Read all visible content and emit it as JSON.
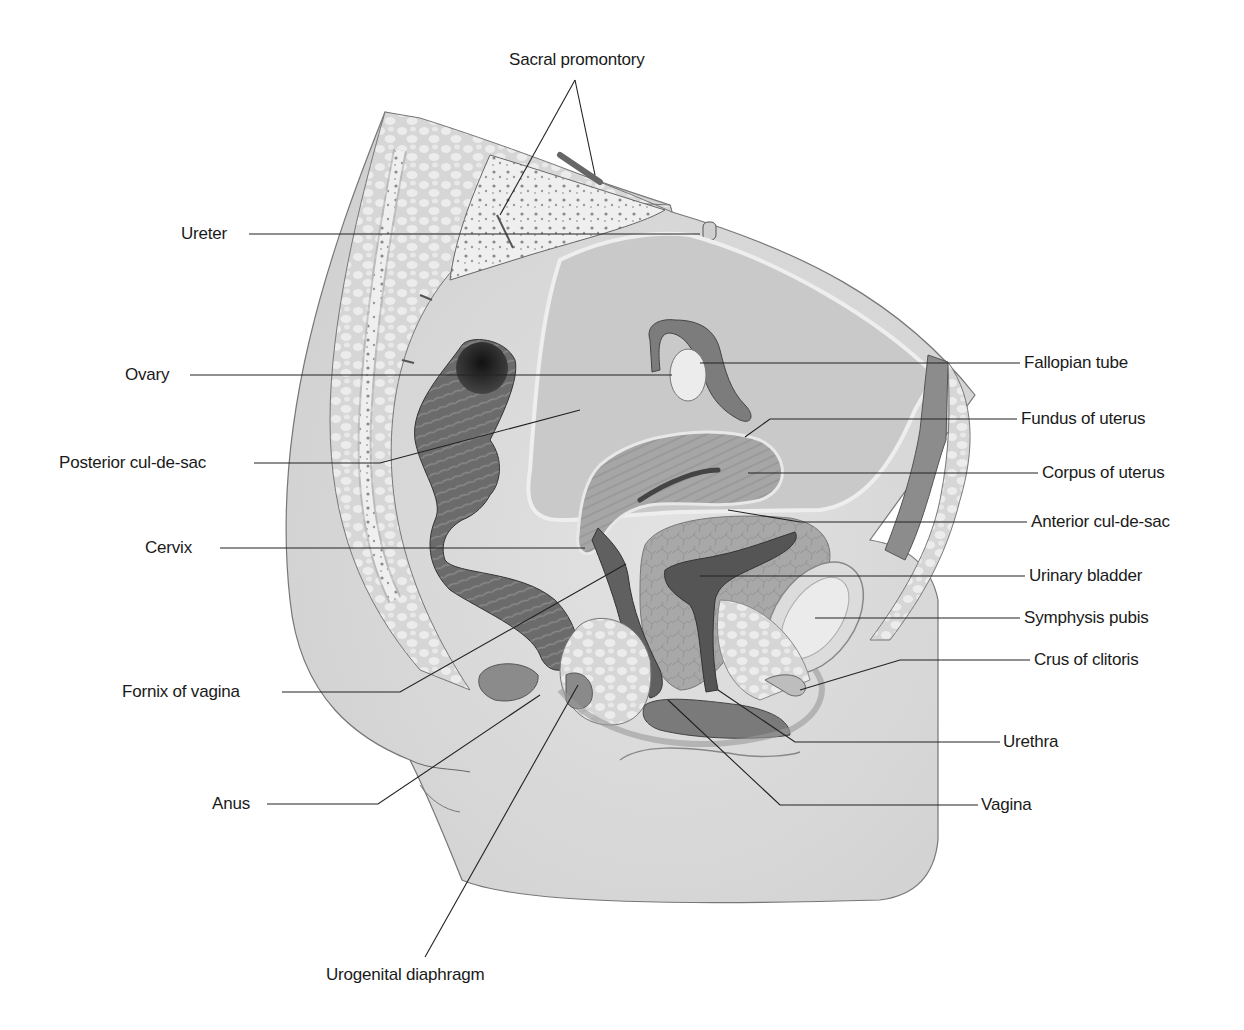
{
  "figure": {
    "type": "anatomical-diagram",
    "style": "grayscale illustration",
    "colors": {
      "background": "#ffffff",
      "skin": "#d9d9d9",
      "skin_shadow": "#bfbfbf",
      "fat": "#e6e6e6",
      "bone": "#eeeeee",
      "peritoneum": "#c8c8c8",
      "organ_mid": "#9a9a9a",
      "organ_dark": "#5a5a5a",
      "rectum": "#6e6e6e",
      "leader_line": "#222222"
    }
  },
  "labels": {
    "left": [
      {
        "id": "ureter",
        "text": "Ureter"
      },
      {
        "id": "ovary",
        "text": "Ovary"
      },
      {
        "id": "posterior_cul_de_sac",
        "text": "Posterior cul-de-sac"
      },
      {
        "id": "cervix",
        "text": "Cervix"
      },
      {
        "id": "fornix_of_vagina",
        "text": "Fornix of vagina"
      },
      {
        "id": "anus",
        "text": "Anus"
      }
    ],
    "right": [
      {
        "id": "fallopian_tube",
        "text": "Fallopian tube"
      },
      {
        "id": "fundus_of_uterus",
        "text": "Fundus of uterus"
      },
      {
        "id": "corpus_of_uterus",
        "text": "Corpus of uterus"
      },
      {
        "id": "anterior_cul_de_sac",
        "text": "Anterior cul-de-sac"
      },
      {
        "id": "urinary_bladder",
        "text": "Urinary bladder"
      },
      {
        "id": "symphysis_pubis",
        "text": "Symphysis pubis"
      },
      {
        "id": "crus_of_clitoris",
        "text": "Crus of clitoris"
      },
      {
        "id": "urethra",
        "text": "Urethra"
      },
      {
        "id": "vagina",
        "text": "Vagina"
      }
    ],
    "top": [
      {
        "id": "sacral_promontory",
        "text": "Sacral promontory"
      }
    ],
    "bottom": [
      {
        "id": "urogenital_diaphragm",
        "text": "Urogenital diaphragm"
      }
    ]
  }
}
